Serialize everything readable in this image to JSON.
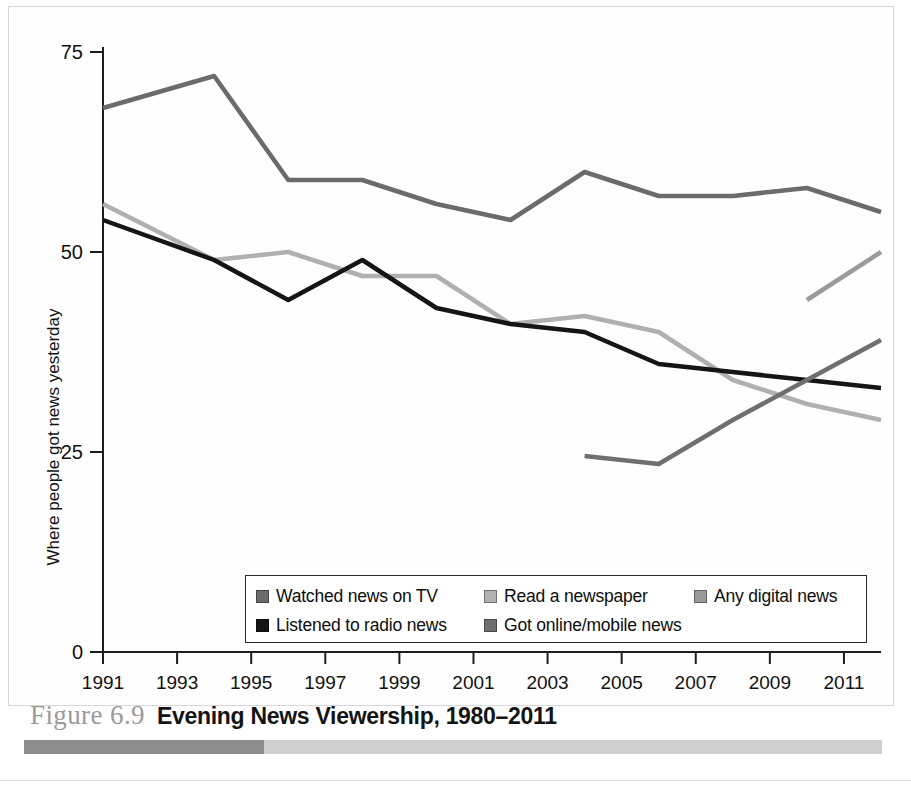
{
  "figure": {
    "number": "Figure 6.9",
    "title": "Evening News Viewership, 1980–2011"
  },
  "axes": {
    "y_title": "Where people got news yesterday",
    "y_ticks": [
      "0",
      "25",
      "50",
      "75"
    ],
    "x_ticks": [
      "1991",
      "1993",
      "1995",
      "1997",
      "1999",
      "2001",
      "2003",
      "2005",
      "2007",
      "2009",
      "2011"
    ]
  },
  "legend": {
    "rows": [
      [
        {
          "label": "Watched news on TV",
          "color": "#6b6b6b"
        },
        {
          "label": "Read a newspaper",
          "color": "#b0b0b0"
        },
        {
          "label": "Any digital news",
          "color": "#9a9a9a"
        }
      ],
      [
        {
          "label": "Listened to radio news",
          "color": "#151515"
        },
        {
          "label": "Got online/mobile news",
          "color": "#6f6f6f"
        }
      ]
    ]
  },
  "chart_data": {
    "type": "line",
    "title": "Evening News Viewership, 1980–2011",
    "xlabel": "",
    "ylabel": "Where people got news yesterday",
    "xlim": [
      1991,
      2012
    ],
    "ylim": [
      0,
      75
    ],
    "grid": false,
    "legend_position": "bottom-inside",
    "x_tick_values": [
      1991,
      1993,
      1995,
      1997,
      1999,
      2001,
      2003,
      2005,
      2007,
      2009,
      2011
    ],
    "y_tick_values": [
      0,
      25,
      50,
      75
    ],
    "series": [
      {
        "name": "Watched news on TV",
        "color": "#6b6b6b",
        "x": [
          1991,
          1994,
          1996,
          1998,
          2000,
          2002,
          2004,
          2006,
          2008,
          2010,
          2012
        ],
        "values": [
          68,
          72,
          59,
          59,
          56,
          54,
          60,
          57,
          57,
          58,
          55
        ]
      },
      {
        "name": "Read a newspaper",
        "color": "#b0b0b0",
        "x": [
          1991,
          1994,
          1996,
          1998,
          2000,
          2002,
          2004,
          2006,
          2008,
          2010,
          2012
        ],
        "values": [
          56,
          49,
          50,
          47,
          47,
          41,
          42,
          40,
          34,
          31,
          29
        ]
      },
      {
        "name": "Listened to radio news",
        "color": "#151515",
        "x": [
          1991,
          1994,
          1996,
          1998,
          2000,
          2002,
          2004,
          2006,
          2008,
          2010,
          2012
        ],
        "values": [
          54,
          49,
          44,
          49,
          43,
          41,
          40,
          36,
          35,
          34,
          33
        ]
      },
      {
        "name": "Got online/mobile news",
        "color": "#6f6f6f",
        "x": [
          2004,
          2006,
          2008,
          2010,
          2012
        ],
        "values": [
          24.5,
          23.5,
          29,
          34,
          39
        ]
      },
      {
        "name": "Any digital news",
        "color": "#9a9a9a",
        "x": [
          2010,
          2012
        ],
        "values": [
          44,
          50
        ]
      }
    ]
  }
}
